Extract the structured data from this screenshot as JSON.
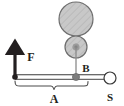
{
  "figure": {
    "background_color": "#ffffff",
    "labels": {
      "force": "F",
      "pivot": "B",
      "arm": "A",
      "support": "S"
    },
    "colors": {
      "stroke_dark": "#231f20",
      "wheel_fill": "#c8c8c8",
      "wheel_stroke": "#6e6e6e",
      "hatch_line": "#a8a8a8",
      "hub_fill": "#8c8c8c",
      "pivot_fill": "#7d7d7d",
      "bar_fill": "#ffffff",
      "support_fill": "#ffffff"
    },
    "elements": {
      "large_wheel": {
        "cx": 76,
        "cy": 19,
        "r": 17,
        "name": "large-wheel"
      },
      "small_wheel": {
        "cx": 76,
        "cy": 47,
        "r": 11,
        "name": "small-wheel"
      },
      "wheel_hub": {
        "cx": 76,
        "cy": 47,
        "r": 3,
        "name": "wheel-hub"
      },
      "axle_line": {
        "x": 76,
        "y1": 47,
        "y2": 77,
        "name": "axle-line"
      },
      "lever_bar": {
        "x1": 15,
        "x2": 110,
        "y": 77,
        "name": "lever-bar"
      },
      "force_arrow": {
        "x": 15,
        "y_tail": 77,
        "y_head": 50,
        "name": "force-arrow"
      },
      "left_node": {
        "cx": 15,
        "cy": 77,
        "r": 2.6,
        "name": "left-node"
      },
      "pivot_node": {
        "cx": 76,
        "cy": 77,
        "r": 3.4,
        "name": "pivot-node"
      },
      "support_ring": {
        "cx": 110,
        "cy": 78,
        "r": 6,
        "name": "support-ring"
      },
      "brace": {
        "x1": 15,
        "x2": 88,
        "y": 86,
        "tip_x": 54,
        "name": "dimension-brace"
      }
    },
    "label_positions": {
      "force": {
        "x": 31,
        "y": 61
      },
      "pivot": {
        "x": 85,
        "y": 72
      },
      "arm": {
        "x": 54,
        "y": 102
      },
      "support": {
        "x": 110,
        "y": 101
      }
    }
  }
}
